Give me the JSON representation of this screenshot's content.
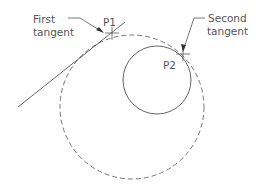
{
  "diagram": {
    "labels": {
      "first_tangent_line1": "First",
      "first_tangent_line2": "tangent",
      "second_tangent_line1": "Second",
      "second_tangent_line2": "tangent",
      "p1": "P1",
      "p2": "P2"
    },
    "colors": {
      "stroke": "#555555",
      "background": "#ffffff"
    },
    "shapes": {
      "tangent_line": {
        "x1": 18,
        "y1": 107,
        "x2": 125,
        "y2": 22
      },
      "small_circle": {
        "cx": 157,
        "cy": 80,
        "r": 34,
        "style": "solid"
      },
      "construction_circle": {
        "cx": 132,
        "cy": 107,
        "r": 72,
        "style": "dashed"
      },
      "p1": {
        "x": 112,
        "y": 33
      },
      "p2": {
        "x": 183,
        "y": 54
      }
    }
  }
}
